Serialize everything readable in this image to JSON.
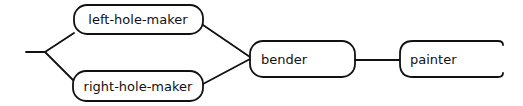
{
  "diagram": {
    "type": "flow",
    "colors": {
      "stroke": "#111111",
      "background": "#ffffff",
      "text": "#111111"
    },
    "nodes": [
      {
        "id": "left-hole-maker",
        "label": "left-hole-maker"
      },
      {
        "id": "right-hole-maker",
        "label": "right-hole-maker"
      },
      {
        "id": "bender",
        "label": "bender"
      },
      {
        "id": "painter",
        "label": "painter"
      }
    ],
    "edges": [
      {
        "from": "entry",
        "to": "left-hole-maker"
      },
      {
        "from": "entry",
        "to": "right-hole-maker"
      },
      {
        "from": "left-hole-maker",
        "to": "bender"
      },
      {
        "from": "right-hole-maker",
        "to": "bender"
      },
      {
        "from": "bender",
        "to": "painter"
      }
    ]
  }
}
